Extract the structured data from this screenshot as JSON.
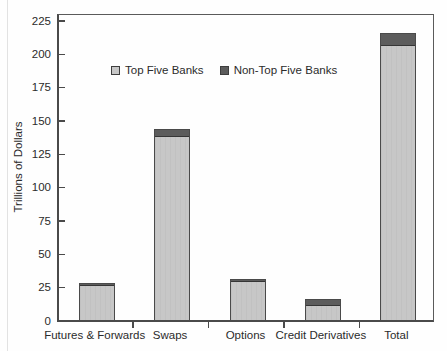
{
  "chart_data": {
    "type": "bar",
    "stacked": true,
    "title": "",
    "ylabel": "Trillions of Dollars",
    "xlabel": "",
    "categories": [
      "Futures & Forwards",
      "Swaps",
      "Options",
      "Credit Derivatives",
      "Total"
    ],
    "series": [
      {
        "name": "Top Five Banks",
        "color": "#c7c7c7",
        "values": [
          26,
          138,
          29,
          11.5,
          206
        ]
      },
      {
        "name": "Non-Top Five Banks",
        "color": "#5c5c5c",
        "values": [
          2,
          5.5,
          2,
          4,
          9
        ]
      }
    ],
    "stack_totals": [
      28,
      143.5,
      31,
      15.5,
      215
    ],
    "ylim": [
      0,
      225
    ],
    "yticks": [
      "0",
      "25",
      "50",
      "75",
      "100",
      "125",
      "150",
      "175",
      "200",
      "225"
    ],
    "legend_position": "upper-left-inside",
    "grid": "off",
    "axis_color": "#4a4a4a",
    "text_color": "#2b2b2b"
  }
}
